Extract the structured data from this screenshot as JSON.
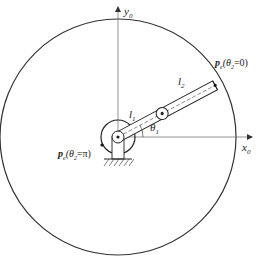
{
  "diagram": {
    "type": "two-link planar arm workspace",
    "colors": {
      "line": "#222222",
      "axis": "#555555",
      "background": "#ffffff"
    },
    "axes": {
      "x": {
        "label": "x",
        "subscript": "0"
      },
      "y": {
        "label": "y",
        "subscript": "0"
      }
    },
    "links": [
      {
        "label": "l",
        "subscript": "1"
      },
      {
        "label": "l",
        "subscript": "2"
      }
    ],
    "angle": {
      "label": "θ",
      "subscript": "1"
    },
    "points": [
      {
        "name": "p",
        "subscript": "e",
        "condition": "(θ",
        "condition_sub": "2",
        "condition_val": "=0)"
      },
      {
        "name": "p",
        "subscript": "e",
        "condition": "(θ",
        "condition_sub": "2",
        "condition_val": "=π)"
      }
    ]
  }
}
